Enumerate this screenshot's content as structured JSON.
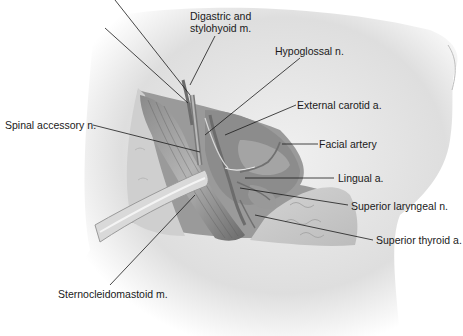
{
  "figure": {
    "labels": [
      {
        "id": "digastric",
        "text": "Digastric and",
        "text2": "stylohyoid m."
      },
      {
        "id": "hypoglossal",
        "text": "Hypoglossal n."
      },
      {
        "id": "external_carotid",
        "text": "External carotid a."
      },
      {
        "id": "facial_artery",
        "text": "Facial artery"
      },
      {
        "id": "spinal_accessory",
        "text": "Spinal accessory n."
      },
      {
        "id": "lingual",
        "text": "Lingual a."
      },
      {
        "id": "superior_laryngeal",
        "text": "Superior laryngeal n."
      },
      {
        "id": "superior_thyroid",
        "text": "Superior thyroid a."
      },
      {
        "id": "sternocleidomastoid",
        "text": "Sternocleidomastoid m."
      }
    ]
  },
  "colors": {
    "skin_light": "#ececec",
    "skin_shadow": "#c4c4c4",
    "tissue": "#a8a8a8",
    "tissue_dark": "#6e6e6e",
    "leader_line": "#1a1a1a"
  }
}
